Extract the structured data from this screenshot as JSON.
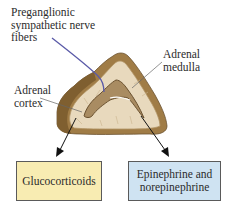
{
  "labels": {
    "nerve_fibers": "Preganglionic\nsympathetic nerve\nfibers",
    "adrenal_medulla": "Adrenal\nmedulla",
    "adrenal_cortex": "Adrenal\ncortex"
  },
  "outputs": {
    "cortex_product": "Glucocorticoids",
    "medulla_product": "Epinephrine and\nnorepinephrine"
  },
  "colors": {
    "gluco_box": "#f8ecb2",
    "epi_box": "#cfe3f2",
    "nerve": "#5a5aa8",
    "capsule": "#9c7a45",
    "cortex": "#e6d7bb",
    "medulla": "#a98c62"
  }
}
